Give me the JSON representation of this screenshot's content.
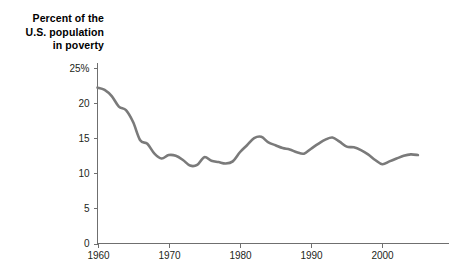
{
  "title": {
    "line1": "Percent of the",
    "line2": "U.S. population",
    "line3": "in poverty"
  },
  "chart_data": {
    "type": "line",
    "title": "Percent of the U.S. population in poverty",
    "xlabel": "",
    "ylabel": "",
    "xlim": [
      1959,
      2006
    ],
    "ylim": [
      0,
      25
    ],
    "grid": false,
    "legend": null,
    "line_color": "#7a7a7a",
    "axis_color": "#6f6f6f",
    "text_color": "#231f20",
    "y_ticks": [
      {
        "value": 25,
        "label": "25%"
      },
      {
        "value": 20,
        "label": "20"
      },
      {
        "value": 15,
        "label": "15"
      },
      {
        "value": 10,
        "label": "10"
      },
      {
        "value": 5,
        "label": "5"
      },
      {
        "value": 0,
        "label": "0"
      }
    ],
    "x_ticks": [
      {
        "value": 1960,
        "label": "1960"
      },
      {
        "value": 1970,
        "label": "1970"
      },
      {
        "value": 1980,
        "label": "1980"
      },
      {
        "value": 1990,
        "label": "1990"
      },
      {
        "value": 2000,
        "label": "2000"
      }
    ],
    "x": [
      1960,
      1961,
      1962,
      1963,
      1964,
      1965,
      1966,
      1967,
      1968,
      1969,
      1970,
      1971,
      1972,
      1973,
      1974,
      1975,
      1976,
      1977,
      1978,
      1979,
      1980,
      1981,
      1982,
      1983,
      1984,
      1985,
      1986,
      1987,
      1988,
      1989,
      1990,
      1991,
      1992,
      1993,
      1994,
      1995,
      1996,
      1997,
      1998,
      1999,
      2000,
      2001,
      2002,
      2003,
      2004,
      2005
    ],
    "values": [
      22.2,
      21.9,
      21.0,
      19.5,
      19.0,
      17.3,
      14.7,
      14.2,
      12.8,
      12.1,
      12.6,
      12.5,
      11.9,
      11.1,
      11.2,
      12.3,
      11.8,
      11.6,
      11.4,
      11.7,
      13.0,
      14.0,
      15.0,
      15.2,
      14.4,
      14.0,
      13.6,
      13.4,
      13.0,
      12.8,
      13.5,
      14.2,
      14.8,
      15.1,
      14.5,
      13.8,
      13.7,
      13.3,
      12.7,
      11.9,
      11.3,
      11.7,
      12.1,
      12.5,
      12.7,
      12.6
    ]
  }
}
